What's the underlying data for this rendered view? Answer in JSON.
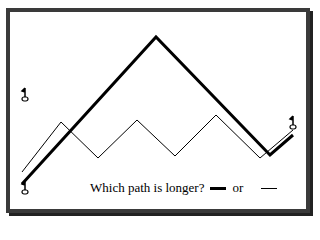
{
  "question": {
    "text": "Which path is longer?",
    "connector": "or"
  },
  "paths": {
    "thick": {
      "name": "thick-path",
      "stroke_width": 3,
      "color": "#000000",
      "points": "22,184 156,37 270,155 293,135"
    },
    "thin": {
      "name": "thin-path",
      "stroke_width": 1,
      "color": "#000000",
      "points": "22,172 61,122 98,158 137,120 175,156 216,115 260,158 293,130"
    }
  },
  "flags": [
    {
      "name": "flag-left-top",
      "x": 25,
      "y": 97
    },
    {
      "name": "flag-left-bottom",
      "x": 25,
      "y": 190
    },
    {
      "name": "flag-right",
      "x": 293,
      "y": 125
    }
  ],
  "colors": {
    "frame": "#3a3a3a",
    "background": "#ffffff",
    "ink": "#000000"
  }
}
